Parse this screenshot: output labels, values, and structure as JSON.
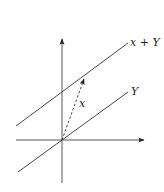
{
  "diagram": {
    "title": "",
    "labels": {
      "x_plus_Y": "x + Y",
      "Y": "Y",
      "x": "x"
    },
    "colors": {
      "stroke": "#333333",
      "background": "#ffffff"
    },
    "geometry": {
      "origin": [
        62,
        140
      ],
      "vertical_axis": {
        "from": [
          62,
          183
        ],
        "to": [
          62,
          37
        ]
      },
      "horizontal_axis": {
        "from": [
          16,
          140
        ],
        "to": [
          146,
          140
        ]
      },
      "line_Y": {
        "from": [
          18,
          172
        ],
        "to": [
          128,
          92
        ]
      },
      "line_x_plus_Y": {
        "from": [
          16,
          126
        ],
        "to": [
          128,
          43
        ]
      },
      "vector_x": {
        "from": [
          62,
          140
        ],
        "to": [
          85,
          77
        ],
        "style": "dashed"
      }
    }
  }
}
